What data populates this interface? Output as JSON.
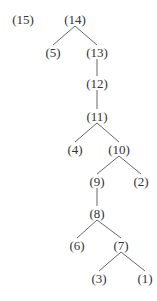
{
  "diagram": {
    "type": "tree",
    "nodes": [
      {
        "id": "15",
        "label": "(15)",
        "x": 23,
        "y": 19
      },
      {
        "id": "14",
        "label": "(14)",
        "x": 75,
        "y": 19
      },
      {
        "id": "5",
        "label": "(5)",
        "x": 53,
        "y": 52
      },
      {
        "id": "13",
        "label": "(13)",
        "x": 97,
        "y": 52
      },
      {
        "id": "12",
        "label": "(12)",
        "x": 97,
        "y": 83
      },
      {
        "id": "11",
        "label": "(11)",
        "x": 97,
        "y": 116
      },
      {
        "id": "4",
        "label": "(4)",
        "x": 75,
        "y": 149
      },
      {
        "id": "10",
        "label": "(10)",
        "x": 119,
        "y": 149
      },
      {
        "id": "9",
        "label": "(9)",
        "x": 97,
        "y": 181
      },
      {
        "id": "2",
        "label": "(2)",
        "x": 141,
        "y": 181
      },
      {
        "id": "8",
        "label": "(8)",
        "x": 97,
        "y": 213
      },
      {
        "id": "6",
        "label": "(6)",
        "x": 77,
        "y": 245
      },
      {
        "id": "7",
        "label": "(7)",
        "x": 121,
        "y": 245
      },
      {
        "id": "3",
        "label": "(3)",
        "x": 99,
        "y": 278
      },
      {
        "id": "1",
        "label": "(1)",
        "x": 145,
        "y": 278
      }
    ],
    "edges": [
      {
        "from": "14",
        "to": "5"
      },
      {
        "from": "14",
        "to": "13"
      },
      {
        "from": "13",
        "to": "12"
      },
      {
        "from": "12",
        "to": "11"
      },
      {
        "from": "11",
        "to": "4"
      },
      {
        "from": "11",
        "to": "10"
      },
      {
        "from": "10",
        "to": "9"
      },
      {
        "from": "10",
        "to": "2"
      },
      {
        "from": "9",
        "to": "8"
      },
      {
        "from": "8",
        "to": "6"
      },
      {
        "from": "8",
        "to": "7"
      },
      {
        "from": "7",
        "to": "3"
      },
      {
        "from": "7",
        "to": "1"
      }
    ]
  }
}
